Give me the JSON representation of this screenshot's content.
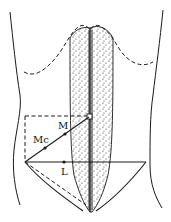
{
  "diagram": {
    "labels": {
      "mc": "Mc",
      "m": "M",
      "l": "L"
    },
    "colors": {
      "line": "#1a1a1a",
      "background": "#ffffff",
      "stipple": "#2a2a2a"
    }
  }
}
